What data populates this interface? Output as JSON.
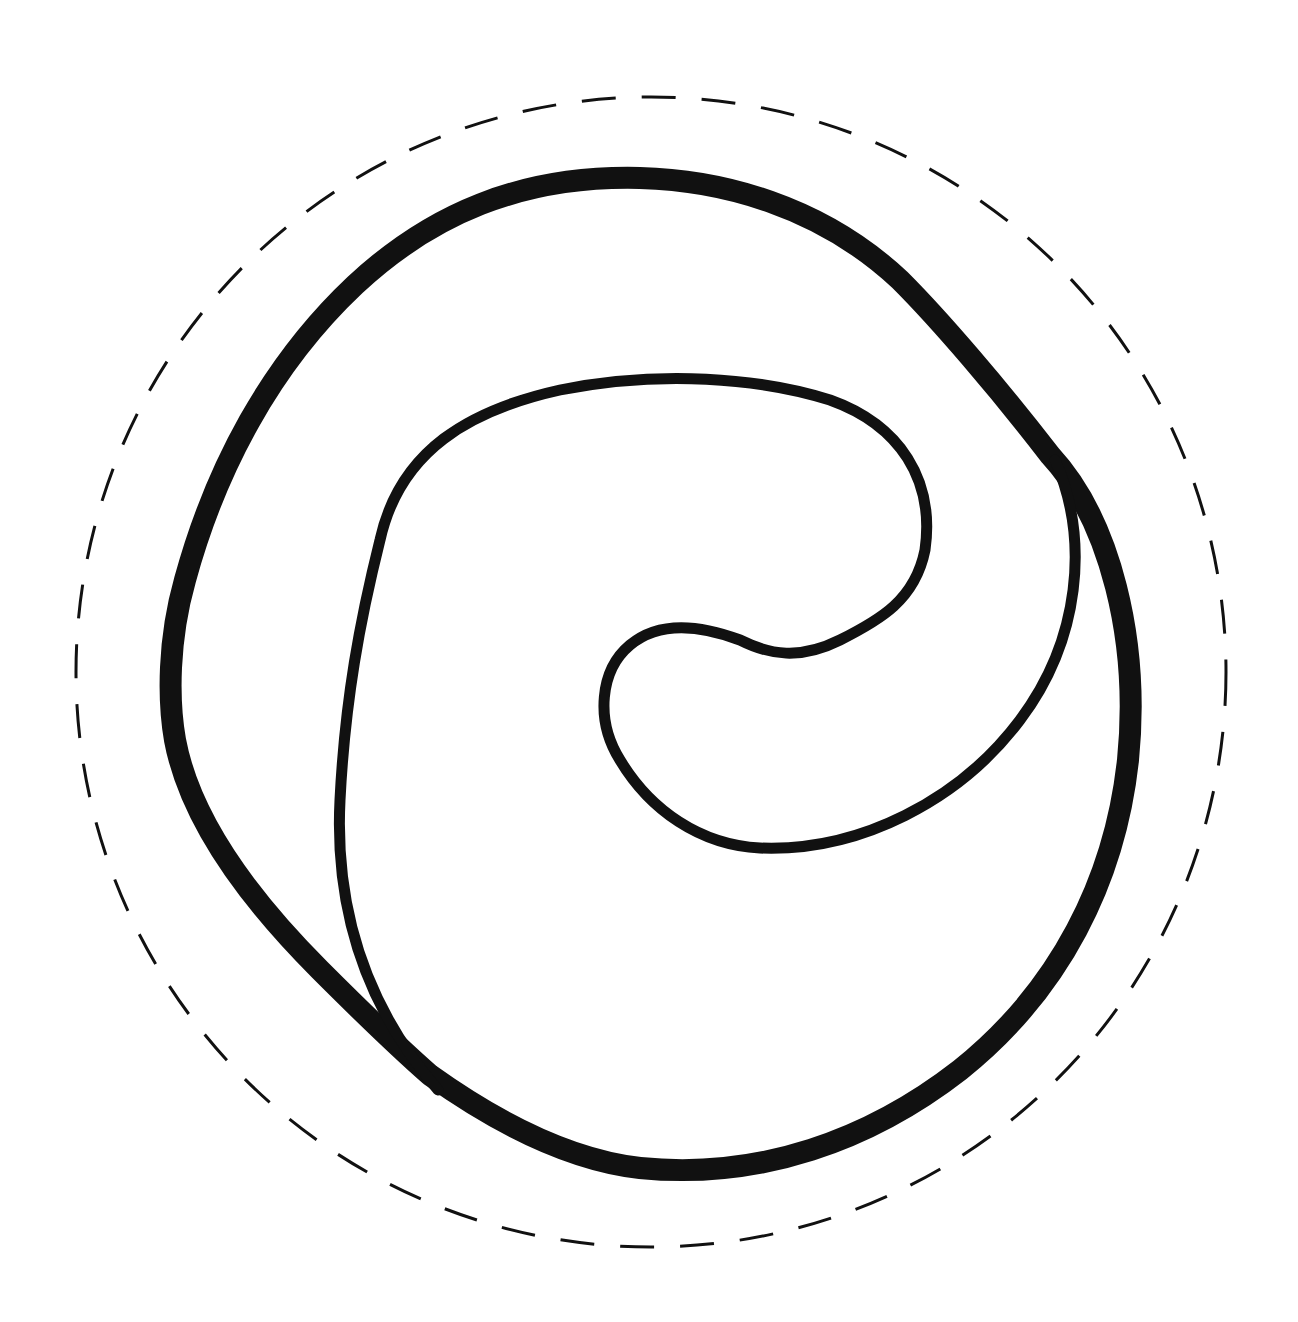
{
  "diagram": {
    "background": "#ffffff",
    "stroke_color": "#111111",
    "dashed_circle": {
      "cx": 651,
      "cy": 672,
      "r": 575,
      "stroke_width": 3,
      "dash": "34 26"
    },
    "outer_loop": {
      "stroke_width": 22
    },
    "inner_spiral": {
      "stroke_width": 11
    }
  }
}
